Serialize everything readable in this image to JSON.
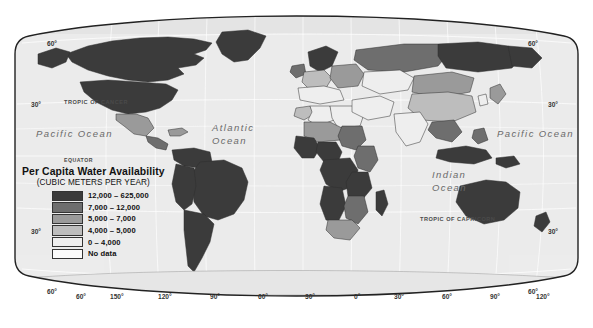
{
  "figure": {
    "kind": "thematic-world-map",
    "projection": "Robinson"
  },
  "legend": {
    "title": "Per Capita Water Availability",
    "subtitle": "(CUBIC METERS PER YEAR)",
    "entries": [
      {
        "label": "12,000 – 625,000",
        "color": "#3b3b3b"
      },
      {
        "label": "7,000 – 12,000",
        "color": "#6e6e6e"
      },
      {
        "label": "5,000 – 7,000",
        "color": "#9a9a9a"
      },
      {
        "label": "4,000 – 5,000",
        "color": "#bdbdbd"
      },
      {
        "label": "0 – 4,000",
        "color": "#eeeeee"
      },
      {
        "label": "No data",
        "color": "#fbfbfb"
      }
    ]
  },
  "ocean_labels": [
    {
      "name": "Pacific Ocean",
      "lines": [
        "Pacific Ocean"
      ],
      "x": 36,
      "y": 128
    },
    {
      "name": "Atlantic Ocean",
      "lines": [
        "Atlantic",
        "Ocean"
      ],
      "x": 212,
      "y": 121
    },
    {
      "name": "Indian Ocean",
      "lines": [
        "Indian",
        "Ocean"
      ],
      "x": 432,
      "y": 168
    },
    {
      "name": "Pacific Ocean",
      "lines": [
        "Pacific Ocean"
      ],
      "x": 497,
      "y": 128
    }
  ],
  "reference_lines": [
    {
      "name": "TROPIC OF CANCER",
      "x": 64,
      "y": 99
    },
    {
      "name": "EQUATOR",
      "x": 64,
      "y": 157
    },
    {
      "name": "TROPIC OF CAPRICORN",
      "x": 420,
      "y": 216
    }
  ],
  "graticule_labels": {
    "latitude_left": [
      {
        "v": "60°",
        "x": 47,
        "y": 40
      },
      {
        "v": "30°",
        "x": 31,
        "y": 101
      },
      {
        "v": "30°",
        "x": 31,
        "y": 228
      },
      {
        "v": "60°",
        "x": 47,
        "y": 288
      }
    ],
    "latitude_right": [
      {
        "v": "60°",
        "x": 528,
        "y": 40
      },
      {
        "v": "30°",
        "x": 548,
        "y": 101
      },
      {
        "v": "30°",
        "x": 548,
        "y": 228
      },
      {
        "v": "60°",
        "x": 528,
        "y": 288
      }
    ],
    "longitude_bottom": [
      {
        "v": "60°",
        "x": 76
      },
      {
        "v": "150°",
        "x": 110
      },
      {
        "v": "120°",
        "x": 158
      },
      {
        "v": "90°",
        "x": 210
      },
      {
        "v": "60°",
        "x": 258
      },
      {
        "v": "30°",
        "x": 305
      },
      {
        "v": "0°",
        "x": 354
      },
      {
        "v": "30°",
        "x": 394
      },
      {
        "v": "60°",
        "x": 442
      },
      {
        "v": "90°",
        "x": 490
      },
      {
        "v": "120°",
        "x": 536
      },
      {
        "v": "150°",
        "x": 586
      },
      {
        "v": "60°",
        "x": 623
      }
    ],
    "longitude_bottom_y": 293
  },
  "palette": {
    "ocean": "#ececec",
    "ocean_edge": "#dcdcdc",
    "frame": "#222222",
    "graticule": "#ffffff",
    "border": "#2e2e2e",
    "land_no_data": "#fafafa"
  }
}
